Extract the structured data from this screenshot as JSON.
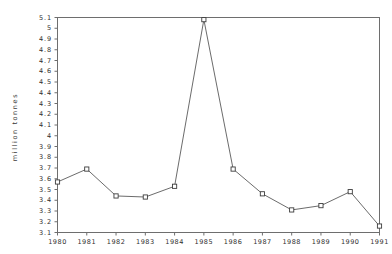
{
  "chart_data": {
    "type": "line",
    "title": "",
    "subtitle": "",
    "xlabel": "",
    "ylabel": "million tonnes",
    "categories": [
      "1980",
      "1981",
      "1982",
      "1983",
      "1984",
      "1985",
      "1986",
      "1987",
      "1988",
      "1989",
      "1990",
      "1991"
    ],
    "x": [
      1980,
      1981,
      1982,
      1983,
      1984,
      1985,
      1986,
      1987,
      1988,
      1989,
      1990,
      1991
    ],
    "values": [
      3.57,
      3.69,
      3.44,
      3.43,
      3.53,
      5.08,
      3.69,
      3.46,
      3.31,
      3.35,
      3.48,
      3.16
    ],
    "series": [
      {
        "name": "million tonnes",
        "values": [
          3.57,
          3.69,
          3.44,
          3.43,
          3.53,
          5.08,
          3.69,
          3.46,
          3.31,
          3.35,
          3.48,
          3.16
        ]
      }
    ],
    "ylim": [
      3.1,
      5.1
    ],
    "xlim": [
      1980,
      1991
    ],
    "ytick_labels": [
      "5.1",
      "5",
      "4.9",
      "4.8",
      "4.7",
      "4.6",
      "4.5",
      "4.4",
      "4.3",
      "4.2",
      "4.1",
      "4",
      "3.9",
      "3.8",
      "3.7",
      "3.6",
      "3.5",
      "3.4",
      "3.3",
      "3.2",
      "3.1"
    ],
    "ytick_values": [
      5.1,
      5.0,
      4.9,
      4.8,
      4.7,
      4.6,
      4.5,
      4.4,
      4.3,
      4.2,
      4.1,
      4.0,
      3.9,
      3.8,
      3.7,
      3.6,
      3.5,
      3.4,
      3.3,
      3.2,
      3.1
    ],
    "xtick_labels": [
      "1980",
      "1981",
      "1982",
      "1983",
      "1984",
      "1985",
      "1986",
      "1987",
      "1988",
      "1989",
      "1990",
      "1991"
    ],
    "grid": false,
    "legend": false,
    "legend_position": "none",
    "marker": "square-open",
    "line_color": "#5a5a5a",
    "marker_edge_color": "#3c3c3c",
    "marker_face_color": "#ffffff",
    "axis_color": "#6e6e6e",
    "background_color": "#ffffff",
    "annotations": []
  }
}
